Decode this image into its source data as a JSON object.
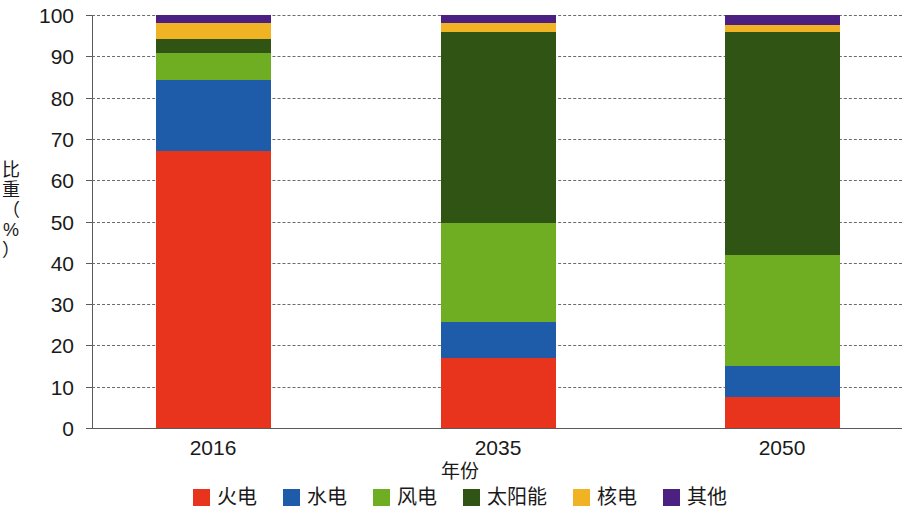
{
  "chart_data": {
    "type": "bar",
    "stacked": true,
    "title": "",
    "xlabel": "年份",
    "ylabel": "比重（%）",
    "categories": [
      "2016",
      "2035",
      "2050"
    ],
    "ylim": [
      0,
      100
    ],
    "yticks": [
      0,
      10,
      20,
      30,
      40,
      50,
      60,
      70,
      80,
      90,
      100
    ],
    "grid": true,
    "legend_position": "bottom",
    "series": [
      {
        "name": "火电",
        "color": "#E8341C",
        "values": [
          67.0,
          17.0,
          7.5
        ]
      },
      {
        "name": "水电",
        "color": "#1E5BA8",
        "values": [
          17.3,
          8.7,
          7.5
        ]
      },
      {
        "name": "风电",
        "color": "#6FAD23",
        "values": [
          6.5,
          24.0,
          27.0
        ]
      },
      {
        "name": "太阳能",
        "color": "#2F5414",
        "values": [
          3.4,
          46.3,
          54.0
        ]
      },
      {
        "name": "核电",
        "color": "#F0B323",
        "values": [
          3.8,
          2.0,
          1.5
        ]
      },
      {
        "name": "其他",
        "color": "#4B2080",
        "values": [
          2.0,
          2.0,
          2.5
        ]
      }
    ]
  },
  "axis": {
    "y_title_chars": [
      "比",
      "重",
      "（",
      "%",
      "）"
    ],
    "y_tick_labels": [
      "0",
      "10",
      "20",
      "30",
      "40",
      "50",
      "60",
      "70",
      "80",
      "90",
      "100"
    ],
    "x_title": "年份",
    "x_tick_labels": [
      "2016",
      "2035",
      "2050"
    ]
  },
  "legend": {
    "items": [
      {
        "label": "火电",
        "color": "#E8341C"
      },
      {
        "label": "水电",
        "color": "#1E5BA8"
      },
      {
        "label": "风电",
        "color": "#6FAD23"
      },
      {
        "label": "太阳能",
        "color": "#2F5414"
      },
      {
        "label": "核电",
        "color": "#F0B323"
      },
      {
        "label": "其他",
        "color": "#4B2080"
      }
    ]
  }
}
